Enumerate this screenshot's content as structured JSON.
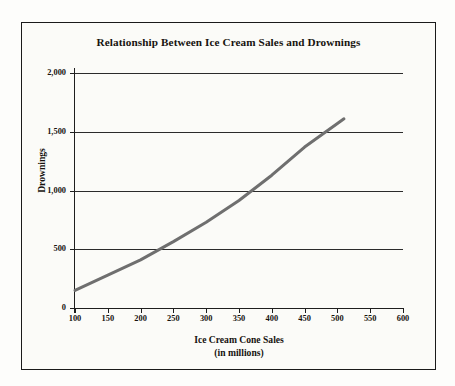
{
  "figure": {
    "background_color": "#fbfbf8",
    "frame_color": "#1a1a1a",
    "title": "Relationship Between Ice Cream Sales and Drownings"
  },
  "chart_data": {
    "type": "line",
    "title": "Relationship Between Ice Cream Sales and Drownings",
    "xlabel": "Ice Cream Cone Sales",
    "xlabel_sub": "(in millions)",
    "ylabel": "Drownings",
    "xlim": [
      100,
      600
    ],
    "ylim": [
      0,
      2000
    ],
    "grid": "horizontal",
    "legend": "none",
    "line_color": "#6f6f6f",
    "line_width_px": 3,
    "x_ticks": [
      100,
      150,
      200,
      250,
      300,
      350,
      400,
      450,
      500,
      550,
      600
    ],
    "x_tick_labels": [
      "100",
      "150",
      "200",
      "250",
      "300",
      "350",
      "400",
      "450",
      "500",
      "550",
      "600"
    ],
    "y_ticks": [
      0,
      500,
      1000,
      1500,
      2000
    ],
    "y_tick_labels": [
      "0",
      "500",
      "1,000",
      "1,500",
      "2,000"
    ],
    "series": [
      {
        "name": "Drownings vs Ice Cream Cone Sales",
        "x": [
          100,
          150,
          200,
          250,
          300,
          350,
          400,
          450,
          500,
          510
        ],
        "values": [
          150,
          280,
          410,
          565,
          730,
          915,
          1130,
          1370,
          1570,
          1610
        ]
      }
    ],
    "annotations": []
  }
}
